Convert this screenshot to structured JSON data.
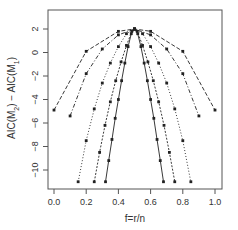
{
  "chart_data": {
    "type": "line",
    "title": "",
    "xlabel": "f=r/n",
    "ylabel": "AIC(M₂) − AIC(M₁)",
    "xlim": [
      -0.04,
      1.04
    ],
    "ylim": [
      -11.7,
      3.6
    ],
    "xticks": [
      0.0,
      0.2,
      0.4,
      0.6,
      0.8,
      1.0
    ],
    "xtick_labels": [
      "0.0",
      "0.2",
      "0.4",
      "0.6",
      "0.8",
      "1.0"
    ],
    "yticks": [
      2,
      0,
      -2,
      -4,
      -6,
      -8,
      -10
    ],
    "ytick_labels": [
      "2",
      "0",
      "−2",
      "−4",
      "−6",
      "−8",
      "−10"
    ],
    "grid": false,
    "legend": null,
    "series": [
      {
        "name": "n=5",
        "style": "dashed",
        "x": [
          0.0,
          0.2,
          0.4,
          0.5,
          0.6,
          0.8,
          1.0
        ],
        "y": [
          -4.9,
          0.1,
          1.8,
          2.0,
          1.8,
          0.1,
          -4.9
        ]
      },
      {
        "name": "n=10",
        "style": "dashdot",
        "x": [
          0.1,
          0.2,
          0.3,
          0.4,
          0.5,
          0.6,
          0.7,
          0.8,
          0.9
        ],
        "y": [
          -5.4,
          -1.8,
          0.3,
          1.5,
          2.0,
          1.5,
          0.3,
          -1.8,
          -5.4
        ]
      },
      {
        "name": "n=20",
        "style": "dotted",
        "x": [
          0.15,
          0.2,
          0.25,
          0.3,
          0.35,
          0.4,
          0.45,
          0.5,
          0.55,
          0.6,
          0.65,
          0.7,
          0.75,
          0.8,
          0.85
        ],
        "y": [
          -11.0,
          -7.5,
          -4.8,
          -2.6,
          -0.9,
          0.5,
          1.6,
          2.0,
          1.6,
          0.5,
          -0.9,
          -2.6,
          -4.8,
          -7.5,
          -11.0
        ]
      },
      {
        "name": "n=30",
        "style": "dashed-dense",
        "x": [
          0.25,
          0.2833,
          0.3167,
          0.35,
          0.3833,
          0.4167,
          0.45,
          0.4833,
          0.5,
          0.5167,
          0.55,
          0.5833,
          0.6167,
          0.65,
          0.6833,
          0.7167,
          0.75
        ],
        "y": [
          -11.0,
          -8.5,
          -6.2,
          -4.2,
          -2.4,
          -0.8,
          0.6,
          1.8,
          2.0,
          1.8,
          0.6,
          -0.8,
          -2.4,
          -4.2,
          -6.2,
          -8.5,
          -11.0
        ]
      },
      {
        "name": "n=50",
        "style": "solid",
        "x": [
          0.32,
          0.34,
          0.36,
          0.38,
          0.4,
          0.42,
          0.44,
          0.46,
          0.48,
          0.5,
          0.52,
          0.54,
          0.56,
          0.58,
          0.6,
          0.62,
          0.64,
          0.66,
          0.68
        ],
        "y": [
          -11.0,
          -9.2,
          -7.4,
          -5.6,
          -4.0,
          -2.4,
          -0.9,
          0.5,
          1.6,
          2.0,
          1.6,
          0.5,
          -0.9,
          -2.4,
          -4.0,
          -5.6,
          -7.4,
          -9.2,
          -11.0
        ]
      }
    ]
  },
  "plot": {
    "x_label": "f=r/n",
    "y_label_main": "AIC(M",
    "y_label_sub2": "2",
    "y_label_mid": ") − AIC(M",
    "y_label_sub1": "1",
    "y_label_end": ")"
  }
}
